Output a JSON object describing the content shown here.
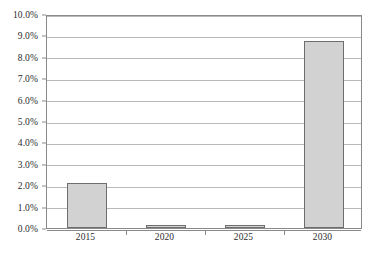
{
  "chart_data": {
    "type": "bar",
    "title": "",
    "subtitle": "",
    "xlabel": "",
    "ylabel": "",
    "categories": [
      "2015",
      "2020",
      "2025",
      "2030"
    ],
    "values": [
      2.1,
      0.15,
      0.15,
      8.75
    ],
    "value_labels": [
      "2.1%",
      "0.15%",
      "0.15%",
      "8.75%"
    ],
    "ylim": [
      0.0,
      10.0
    ],
    "ytick_values": [
      0.0,
      1.0,
      2.0,
      3.0,
      4.0,
      5.0,
      6.0,
      7.0,
      8.0,
      9.0,
      10.0
    ],
    "ytick_labels": [
      "0.0%",
      "1.0%",
      "2.0%",
      "3.0%",
      "4.0%",
      "5.0%",
      "6.0%",
      "7.0%",
      "8.0%",
      "9.0%",
      "10.0%"
    ],
    "grid": true,
    "grid_axis": "y",
    "legend": false,
    "legend_position": "none",
    "series": [
      {
        "name": "",
        "values": [
          2.1,
          0.15,
          0.15,
          8.75
        ]
      }
    ],
    "colors": {
      "bar_fill": "#d2d2d2",
      "bar_border": "#6e6e6e",
      "gridline": "#b8b8b8",
      "axis": "#8a8a8a",
      "text": "#2b2b2b",
      "background": "#ffffff"
    }
  }
}
